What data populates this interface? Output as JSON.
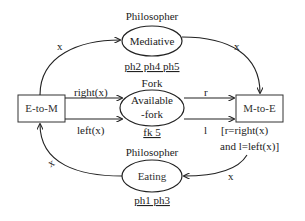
{
  "diagram": {
    "type": "petri-net",
    "places": [
      {
        "id": "mediative",
        "title": "Philosopher",
        "label": "Mediative",
        "tokens": "ph2 ph4 ph5"
      },
      {
        "id": "fork",
        "title": "Fork",
        "label_line1": "Available",
        "label_line2": "-fork",
        "tokens": "fk 5"
      },
      {
        "id": "eating",
        "title": "Philosopher",
        "label": "Eating",
        "tokens": "ph1 ph3"
      }
    ],
    "transitions": [
      {
        "id": "e-to-m",
        "label": "E-to-M"
      },
      {
        "id": "m-to-e",
        "label": "M-to-E",
        "guard_line1": "[r=right(x)",
        "guard_line2": "and l=left(x)]"
      }
    ],
    "arcs": [
      {
        "from": "e-to-m",
        "to": "mediative",
        "label": "x"
      },
      {
        "from": "mediative",
        "to": "m-to-e",
        "label": "x"
      },
      {
        "from": "e-to-m",
        "to": "fork",
        "label": "right(x)"
      },
      {
        "from": "e-to-m",
        "to": "fork",
        "label": "left(x)"
      },
      {
        "from": "fork",
        "to": "m-to-e",
        "label": "r"
      },
      {
        "from": "fork",
        "to": "m-to-e",
        "label": "l"
      },
      {
        "from": "m-to-e",
        "to": "eating",
        "label": "x"
      },
      {
        "from": "eating",
        "to": "e-to-m",
        "label": "x"
      }
    ]
  }
}
